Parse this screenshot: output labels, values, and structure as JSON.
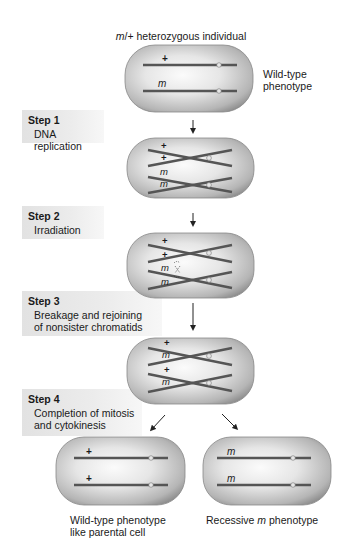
{
  "title": {
    "allele": "m",
    "rest": "/+ heterozygous individual"
  },
  "initial_cell": {
    "label_line1": "Wild-type",
    "label_line2": "phenotype",
    "chromosomes": [
      "+",
      "m"
    ]
  },
  "steps": [
    {
      "title": "Step 1",
      "desc_line1": "DNA replication",
      "desc_line2": ""
    },
    {
      "title": "Step 2",
      "desc_line1": "Irradiation",
      "desc_line2": ""
    },
    {
      "title": "Step 3",
      "desc_line1": "Breakage and rejoining",
      "desc_line2": "of nonsister chromatids"
    },
    {
      "title": "Step 4",
      "desc_line1": "Completion of mitosis",
      "desc_line2": "and cytokinesis"
    }
  ],
  "cells": {
    "replicated": [
      "+",
      "+",
      "m",
      "m"
    ],
    "irradiated": [
      "+",
      "+",
      "m",
      "m"
    ],
    "recombined": [
      "+",
      "m",
      "+",
      "m"
    ],
    "daughter_left": [
      "+",
      "+"
    ],
    "daughter_right": [
      "m",
      "m"
    ]
  },
  "outcomes": {
    "left_line1": "Wild-type phenotype",
    "left_line2": "like parental cell",
    "right_prefix": "Recessive ",
    "right_allele": "m",
    "right_suffix": " phenotype"
  },
  "colors": {
    "cell_fill_center": "#f4f4f4",
    "cell_fill_edge": "#9a9a9a",
    "chromosome": "#5a5a5a",
    "centromere": "#e8e8e8",
    "step_box": "#e4e4e4"
  }
}
